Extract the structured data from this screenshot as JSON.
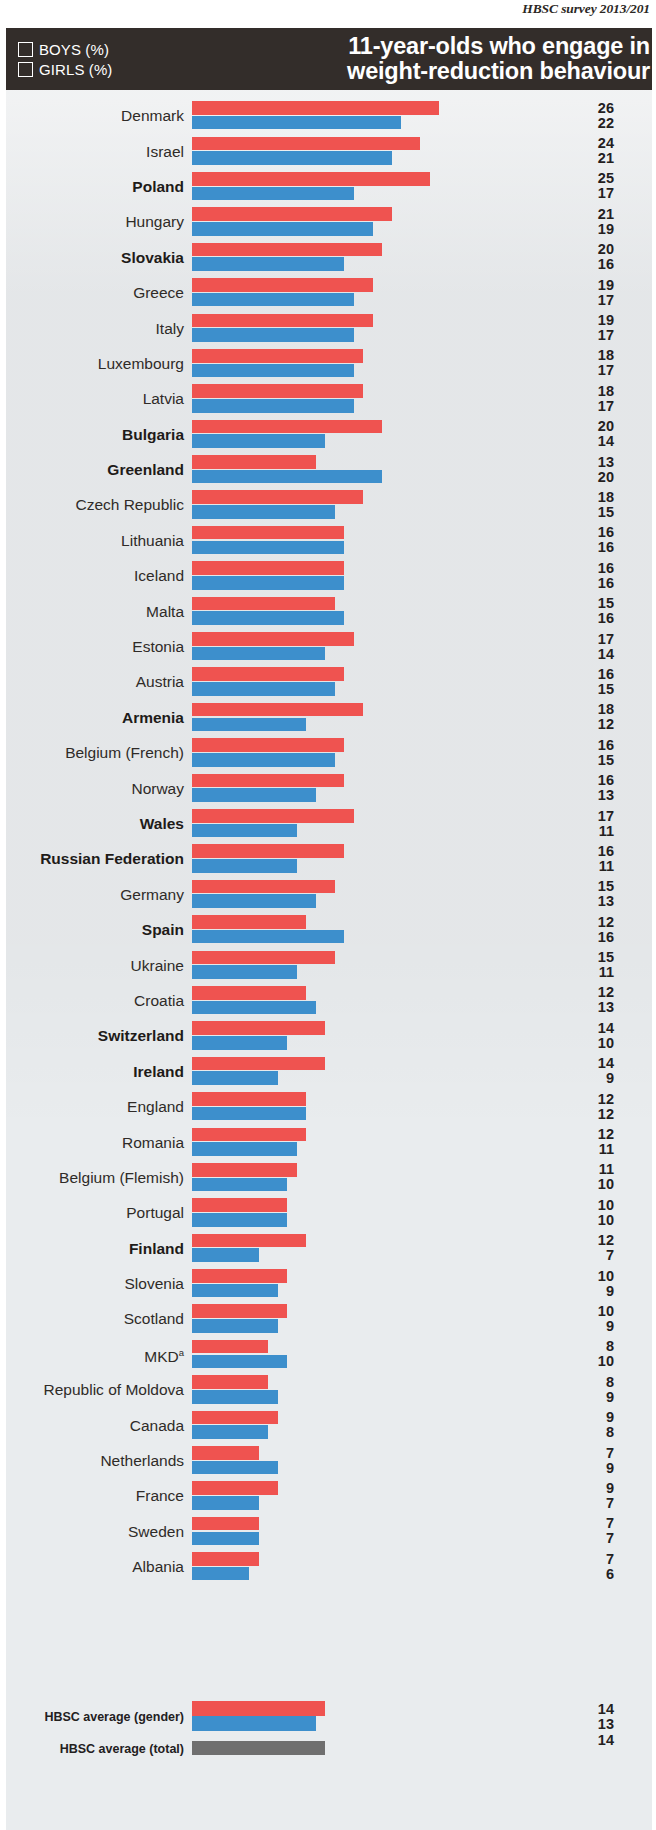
{
  "running_head": "HBSC survey 2013/201",
  "title_line1": "11-year-olds who engage in",
  "title_line2": "weight-reduction behaviour",
  "legend": {
    "boys_label": "BOYS (%)",
    "girls_label": "GIRLS (%)"
  },
  "colors": {
    "boys": "#3d8fcc",
    "girls": "#ef5350",
    "total": "#6f6f6f",
    "header_band": "#332d2a",
    "plot_background": "#e9ecee"
  },
  "chart_data": {
    "type": "bar",
    "title": "11-year-olds who engage in weight-reduction behaviour",
    "subtitle": "HBSC survey 2013/201",
    "xlabel": "",
    "ylabel": "",
    "xlim": [
      0,
      26
    ],
    "grid": false,
    "legend_position": "top-left",
    "orientation": "horizontal",
    "value_unit": "%",
    "categories": [
      "Denmark",
      "Israel",
      "Poland",
      "Hungary",
      "Slovakia",
      "Greece",
      "Italy",
      "Luxembourg",
      "Latvia",
      "Bulgaria",
      "Greenland",
      "Czech Republic",
      "Lithuania",
      "Iceland",
      "Malta",
      "Estonia",
      "Austria",
      "Armenia",
      "Belgium (French)",
      "Norway",
      "Wales",
      "Russian Federation",
      "Germany",
      "Spain",
      "Ukraine",
      "Croatia",
      "Switzerland",
      "Ireland",
      "England",
      "Romania",
      "Belgium (Flemish)",
      "Portugal",
      "Finland",
      "Slovenia",
      "Scotland",
      "MKD",
      "Republic of Moldova",
      "Canada",
      "Netherlands",
      "France",
      "Sweden",
      "Albania"
    ],
    "series": [
      {
        "name": "GIRLS (%)",
        "values": [
          26,
          24,
          25,
          21,
          20,
          19,
          19,
          18,
          18,
          20,
          13,
          18,
          16,
          16,
          15,
          17,
          16,
          18,
          16,
          16,
          17,
          16,
          15,
          12,
          15,
          12,
          14,
          14,
          12,
          12,
          11,
          10,
          12,
          10,
          10,
          8,
          8,
          9,
          7,
          9,
          7,
          7
        ]
      },
      {
        "name": "BOYS (%)",
        "values": [
          22,
          21,
          17,
          19,
          16,
          17,
          17,
          17,
          17,
          14,
          20,
          15,
          16,
          16,
          16,
          14,
          15,
          12,
          15,
          13,
          11,
          11,
          13,
          16,
          11,
          13,
          10,
          9,
          12,
          11,
          10,
          10,
          7,
          9,
          9,
          10,
          9,
          8,
          9,
          7,
          7,
          6
        ]
      }
    ],
    "bold_categories": [
      "Poland",
      "Slovakia",
      "Bulgaria",
      "Greenland",
      "Armenia",
      "Wales",
      "Russian Federation",
      "Spain",
      "Switzerland",
      "Ireland",
      "Finland"
    ],
    "footnote_markers": {
      "MKD": "a"
    },
    "averages": [
      {
        "label": "HBSC average (gender)",
        "girls": 14,
        "boys": 13
      },
      {
        "label": "HBSC average (total)",
        "total": 14
      }
    ]
  }
}
